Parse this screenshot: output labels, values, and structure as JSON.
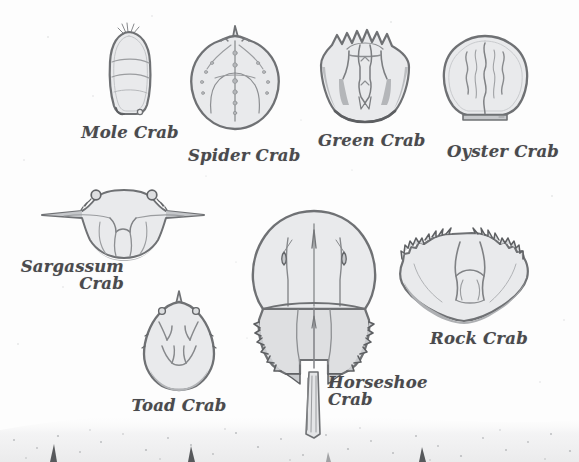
{
  "page": {
    "background_color": "#fdfdfd",
    "ink_color": "#4a4a4d",
    "shell_fill_color": "#e9eaec",
    "shell_outline_color": "#6f7174",
    "medium": "pencil sketch on paper",
    "sand_band_color": "#f4f4f4"
  },
  "figures": [
    {
      "id": "mole-crab",
      "label": "Mole Crab",
      "label_lines": [
        "Mole Crab"
      ],
      "label_align": "center",
      "shape": "elongated oval, narrow, rounded top with antennae tuft, squared bottom",
      "features": [
        "antennae tuft",
        "two horizontal band lines",
        "small bottom nubs"
      ],
      "x": 97,
      "y": 22,
      "w": 66,
      "h": 100,
      "label_x": 78,
      "label_y": 124
    },
    {
      "id": "spider-crab",
      "label": "Spider Crab",
      "label_lines": [
        "Spider Crab"
      ],
      "label_align": "center",
      "shape": "broad rounded triangle, pointed rostrum at top",
      "features": [
        "rostrum spike",
        "nodular tubercle lines",
        "bumpy margins"
      ],
      "x": 185,
      "y": 25,
      "w": 100,
      "h": 105,
      "label_x": 188,
      "label_y": 147
    },
    {
      "id": "green-crab",
      "label": "Green Crab",
      "label_lines": [
        "Green Crab"
      ],
      "label_align": "center",
      "shape": "trapezoidal, spiny sawtooth anterior margin",
      "features": [
        "five marginal teeth",
        "H-shaped gastric region",
        "flared frontal spines"
      ],
      "x": 313,
      "y": 27,
      "w": 104,
      "h": 100,
      "label_x": 318,
      "label_y": 132
    },
    {
      "id": "oyster-crab",
      "label": "Oyster Crab",
      "label_lines": [
        "Oyster Crab"
      ],
      "label_align": "center",
      "shape": "round soft-edged dome with flat base",
      "features": [
        "three wavy vertical furrows",
        "smooth margin",
        "flat posterior"
      ],
      "x": 437,
      "y": 30,
      "w": 97,
      "h": 95,
      "label_x": 447,
      "label_y": 143
    },
    {
      "id": "sargassum-crab",
      "label": "Sargassum Crab",
      "label_lines": [
        "Sargassum",
        "Crab"
      ],
      "label_align": "right",
      "shape": "wide with long lateral spines projecting left and right",
      "features": [
        "two orbital eye bumps",
        "long lateral spines",
        "lobed posterior"
      ],
      "x": 36,
      "y": 186,
      "w": 172,
      "h": 78,
      "label_x": 12,
      "label_y": 258
    },
    {
      "id": "toad-crab",
      "label": "Toad Crab",
      "label_lines": [
        "Toad Crab"
      ],
      "label_align": "center",
      "shape": "teardrop / pear outline, pointed rostrum at top",
      "features": [
        "pointed rostrum",
        "two orbital bumps",
        "branching V furrows"
      ],
      "x": 134,
      "y": 290,
      "w": 90,
      "h": 100,
      "label_x": 127,
      "label_y": 397
    },
    {
      "id": "horseshoe-crab",
      "label": "Horseshoe Crab",
      "label_lines": [
        "Horseshoe",
        "Crab"
      ],
      "label_align": "left",
      "shape": "domed prosoma, hexagonal opisthosoma, long telson tail",
      "features": [
        "compound eye ridges",
        "serrated opisthosoma margin",
        "long spike telson"
      ],
      "x": 250,
      "y": 208,
      "w": 128,
      "h": 230,
      "label_x": 328,
      "label_y": 374
    },
    {
      "id": "rock-crab",
      "label": "Rock Crab",
      "label_lines": [
        "Rock Crab"
      ],
      "label_align": "center",
      "shape": "broad fan, serrated anterolateral margins",
      "features": [
        "nine marginal teeth",
        "central Y furrow",
        "wavy posterior edge"
      ],
      "x": 394,
      "y": 228,
      "w": 140,
      "h": 100,
      "label_x": 425,
      "label_y": 330
    }
  ]
}
